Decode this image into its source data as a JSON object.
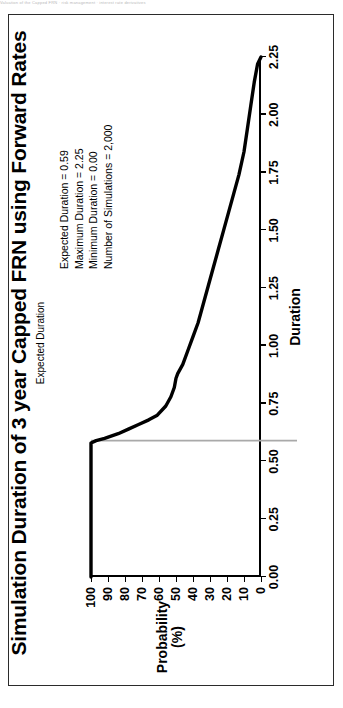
{
  "page": {
    "scan_header": "Valuation of the Capped FRN   · risk management · interest rate derivatives"
  },
  "chart_data": {
    "type": "line",
    "title": "Simulation Duration of 3 year Capped FRN using Forward Rates",
    "subtitle": "Expected Duration",
    "xlabel": "Duration",
    "ylabel": "Probability\n(%)",
    "ylabel_line1": "Probability",
    "ylabel_line2": "(%)",
    "xlim": [
      0.0,
      2.25
    ],
    "ylim": [
      0,
      100
    ],
    "grid": false,
    "legend": "none",
    "xticks": [
      "0.00",
      "0.25",
      "0.50",
      "0.75",
      "1.00",
      "1.25",
      "1.50",
      "1.75",
      "2.00",
      "2.25"
    ],
    "xtick_values": [
      0.0,
      0.25,
      0.5,
      0.75,
      1.0,
      1.25,
      1.5,
      1.75,
      2.0,
      2.25
    ],
    "yticks": [
      "100",
      "90",
      "80",
      "70",
      "60",
      "50",
      "40",
      "30",
      "20",
      "10",
      "0"
    ],
    "ytick_values": [
      100,
      90,
      80,
      70,
      60,
      50,
      40,
      30,
      20,
      10,
      0
    ],
    "series": [
      {
        "name": "Simulated duration distribution",
        "color": "#000000",
        "x": [
          0.0,
          0.1,
          0.2,
          0.3,
          0.4,
          0.5,
          0.56,
          0.58,
          0.59,
          0.6,
          0.62,
          0.64,
          0.66,
          0.68,
          0.7,
          0.74,
          0.78,
          0.82,
          0.86,
          0.88,
          0.92,
          0.98,
          1.04,
          1.1,
          1.18,
          1.26,
          1.34,
          1.42,
          1.5,
          1.58,
          1.66,
          1.74,
          1.84,
          1.94,
          2.04,
          2.14,
          2.22,
          2.25
        ],
        "y": [
          100,
          100,
          100,
          100,
          100,
          100,
          100,
          100,
          97,
          92,
          84,
          78,
          72,
          66,
          61,
          56,
          53,
          51,
          50,
          49,
          46,
          43,
          40,
          37,
          34,
          31,
          28,
          25,
          22,
          19,
          16,
          13,
          10,
          8,
          6,
          4,
          2,
          0
        ]
      }
    ],
    "reference_line": {
      "name": "Expected Duration",
      "orientation": "vertical-in-duration",
      "value": 0.59,
      "color": "#a9a9a9"
    },
    "annotations": [
      "Expected Duration = 0.59",
      "Maximum Duration = 2.25",
      "Minimum Duration = 0.00",
      "Number of Simulations = 2,000"
    ]
  }
}
